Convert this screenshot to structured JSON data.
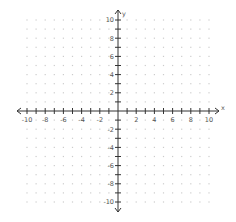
{
  "chart_data": {
    "type": "scatter",
    "title": "",
    "xlabel": "x",
    "ylabel": "y",
    "xlim": [
      -10,
      10
    ],
    "ylim": [
      -10,
      10
    ],
    "grid": "dots",
    "x_tick_step": 1,
    "y_tick_step": 1,
    "x_tick_labels": [
      "-10",
      "-8",
      "-6",
      "-4",
      "-2",
      "2",
      "4",
      "6",
      "8",
      "10"
    ],
    "y_tick_labels": [
      "10",
      "8",
      "6",
      "4",
      "2",
      "-2",
      "-4",
      "-6",
      "-8",
      "-10"
    ],
    "series": []
  },
  "layout": {
    "origin_px": [
      118,
      111
    ],
    "unit_px": 9.1,
    "axis_color": "#333333",
    "grid_dot_color": "#cccccc",
    "label_color": "#555555"
  }
}
